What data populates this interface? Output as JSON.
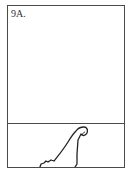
{
  "panel": {
    "label": "9A.",
    "figure": "bowing-figure",
    "colors": {
      "stroke": "#222222",
      "border": "#4a4a4a",
      "background": "#ffffff"
    }
  }
}
